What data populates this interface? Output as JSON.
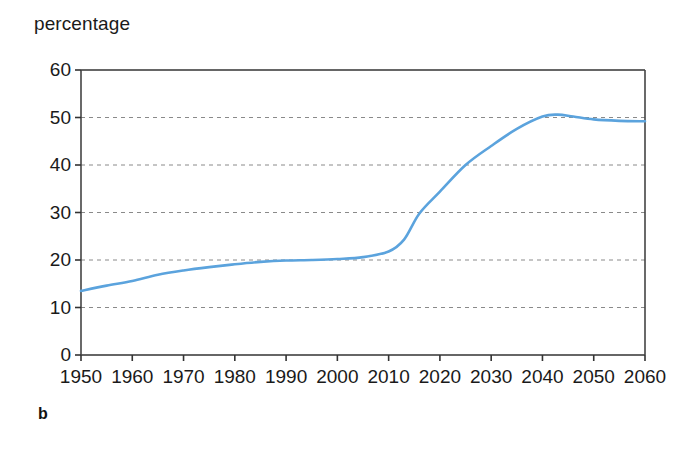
{
  "figure": {
    "panel_label": "b",
    "axis_title": "percentage"
  },
  "chart_data": {
    "type": "line",
    "title": "",
    "subtitle": "",
    "xlabel": "",
    "ylabel": "percentage",
    "grid": true,
    "legend": null,
    "xlim": [
      1950,
      2060
    ],
    "ylim": [
      0,
      60
    ],
    "xticks": [
      1950,
      1960,
      1970,
      1980,
      1990,
      2000,
      2010,
      2020,
      2030,
      2040,
      2050,
      2060
    ],
    "yticks": [
      0,
      10,
      20,
      30,
      40,
      50,
      60
    ],
    "xtick_labels": [
      "1950",
      "1960",
      "1970",
      "1980",
      "1990",
      "2000",
      "2010",
      "2020",
      "2030",
      "2040",
      "2050",
      "2060"
    ],
    "ytick_labels": [
      "0",
      "10",
      "20",
      "30",
      "40",
      "50",
      "60"
    ],
    "line_color": "#5ba3dd",
    "series": [
      {
        "name": "percentage",
        "color": "#5ba3dd",
        "x": [
          1950,
          1955,
          1960,
          1965,
          1970,
          1975,
          1980,
          1985,
          1990,
          1995,
          2000,
          2005,
          2010,
          2013,
          2016,
          2020,
          2025,
          2030,
          2035,
          2040,
          2043,
          2046,
          2050,
          2055,
          2060
        ],
        "values": [
          13.5,
          14.6,
          15.6,
          16.9,
          17.8,
          18.5,
          19.1,
          19.6,
          19.9,
          20.0,
          20.2,
          20.6,
          21.8,
          24.3,
          29.8,
          34.4,
          40.0,
          44.0,
          47.6,
          50.2,
          50.6,
          50.2,
          49.6,
          49.3,
          49.2
        ]
      }
    ],
    "annotations": []
  }
}
